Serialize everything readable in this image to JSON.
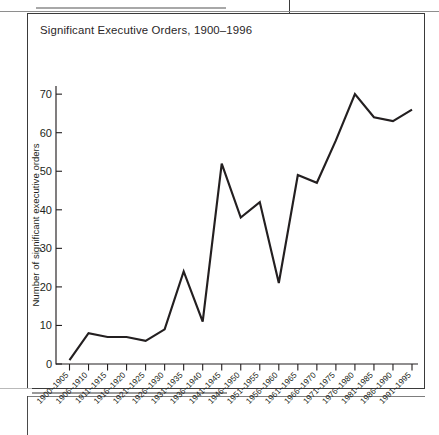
{
  "page": {
    "figure_number_label": "FIGURE 4.2"
  },
  "figure": {
    "caption": "Significant Executive Orders, 1900–1996"
  },
  "colors": {
    "line": "#231f20",
    "axis": "#231f20",
    "figure_border": "#3a3a3a",
    "rule": "#9a9a9a",
    "background": "#ffffff"
  },
  "chart_data": {
    "type": "line",
    "title": "Significant Executive Orders, 1900–1996",
    "xlabel": "",
    "ylabel": "Number of significant executive orders",
    "ylim": [
      0,
      74
    ],
    "yticks": [
      0,
      10,
      20,
      30,
      40,
      50,
      60,
      70
    ],
    "ytick_labels": [
      "0",
      "10",
      "20",
      "30",
      "40",
      "50",
      "60",
      "70"
    ],
    "grid": false,
    "legend": false,
    "legend_position": "none",
    "categories": [
      "1900–1905",
      "1906–1910",
      "1911–1915",
      "1916–1920",
      "1921–1925",
      "1926–1930",
      "1931–1935",
      "1936–1940",
      "1941–1945",
      "1946–1950",
      "1951–1955",
      "1956–1960",
      "1961–1965",
      "1966–1970",
      "1971–1975",
      "1976–1980",
      "1981–1985",
      "1986–1990",
      "1991–1995"
    ],
    "values": [
      1,
      8,
      7,
      7,
      6,
      9,
      24,
      11,
      52,
      38,
      42,
      21,
      49,
      47,
      58,
      70,
      64,
      63,
      66
    ],
    "series": [
      {
        "name": "Number of significant executive orders",
        "values": [
          1,
          8,
          7,
          7,
          6,
          9,
          24,
          11,
          52,
          38,
          42,
          21,
          49,
          47,
          58,
          70,
          64,
          63,
          66
        ]
      }
    ]
  }
}
